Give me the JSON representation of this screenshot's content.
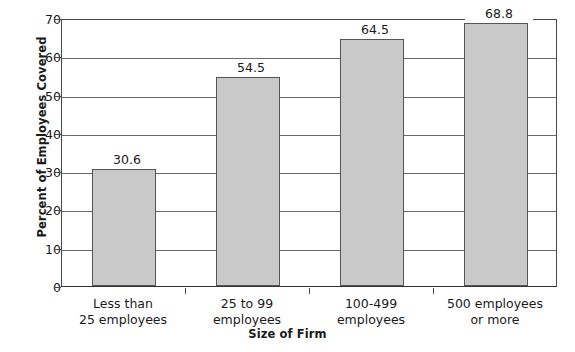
{
  "chart_data": {
    "type": "bar",
    "title": "",
    "xlabel": "Size of Firm",
    "ylabel": "Percent of Employees Covered",
    "categories": [
      "Less than 25 employees",
      "25 to 99 employees",
      "100-499 employees",
      "500 employees or more"
    ],
    "category_lines": [
      [
        "Less than",
        "25 employees"
      ],
      [
        "25 to 99",
        "employees"
      ],
      [
        "100-499",
        "employees"
      ],
      [
        "500 employees",
        "or more"
      ]
    ],
    "values": [
      30.6,
      54.5,
      64.5,
      68.8
    ],
    "value_labels": [
      "30.6",
      "54.5",
      "64.5",
      "68.8"
    ],
    "ylim": [
      0,
      70
    ],
    "ytick_labels": [
      "70",
      "60",
      "50",
      "40",
      "30",
      "20",
      "10",
      "0"
    ],
    "ytick_values": [
      70,
      60,
      50,
      40,
      30,
      20,
      10,
      0
    ],
    "grid": true,
    "legend": null,
    "bar_color": "#c9c9c9",
    "bar_border_color": "#555555",
    "axis_color": "#4a4a4a",
    "grid_color": "#6b6b6b",
    "background_color": "#ffffff",
    "text_color": "#1a1a1a"
  }
}
